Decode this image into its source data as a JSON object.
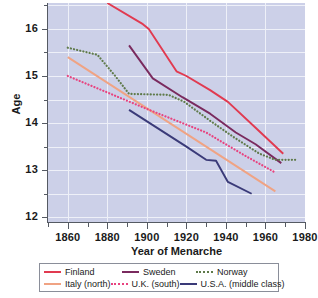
{
  "chart_data": {
    "type": "line",
    "title": "",
    "xlabel": "Year of Menarche",
    "ylabel": "Age",
    "xlim": [
      1850,
      1980
    ],
    "ylim": [
      11.9,
      16.55
    ],
    "xticks": [
      1860,
      1880,
      1900,
      1920,
      1940,
      1960,
      1980
    ],
    "yticks": [
      12,
      13,
      14,
      15,
      16
    ],
    "yminorticks": [
      12.5,
      13.5,
      14.5,
      15.5,
      16.5
    ],
    "xminorticks": [
      1850,
      1870,
      1890,
      1910,
      1930,
      1950,
      1970
    ],
    "grid": true,
    "legend_position": "below",
    "plot_background": "#ccd0e8",
    "gridline_color": "#eef0f8",
    "series": [
      {
        "name": "Finland",
        "color": "#e13a50",
        "style": "solid",
        "x": [
          1880,
          1898,
          1901,
          1915,
          1920,
          1932,
          1941,
          1955,
          1969
        ],
        "y": [
          16.55,
          16.1,
          16.0,
          15.1,
          15.0,
          14.7,
          14.45,
          13.9,
          13.35
        ]
      },
      {
        "name": "Sweden",
        "color": "#7a2a5e",
        "style": "solid",
        "x": [
          1891,
          1903,
          1918,
          1932,
          1945,
          1955,
          1968
        ],
        "y": [
          15.65,
          14.95,
          14.55,
          14.2,
          13.8,
          13.55,
          13.15
        ]
      },
      {
        "name": "Norway",
        "color": "#5f7a4a",
        "style": "dotted",
        "x": [
          1860,
          1875,
          1884,
          1891,
          1911,
          1919,
          1932,
          1944,
          1957,
          1965,
          1975
        ],
        "y": [
          15.6,
          15.45,
          15.0,
          14.62,
          14.6,
          14.45,
          14.05,
          13.7,
          13.35,
          13.22,
          13.22
        ]
      },
      {
        "name": "Italy (north)",
        "color": "#f0a383",
        "style": "solid",
        "x": [
          1860,
          1965
        ],
        "y": [
          15.4,
          12.55
        ]
      },
      {
        "name": "U.K. (south)",
        "color": "#e8437f",
        "style": "dotted",
        "x": [
          1860,
          1900,
          1930,
          1950,
          1965
        ],
        "y": [
          15.0,
          14.3,
          13.8,
          13.3,
          12.95
        ]
      },
      {
        "name": "U.S.A. (middle class)",
        "color": "#3a3a78",
        "style": "solid",
        "x": [
          1891,
          1920,
          1930,
          1935,
          1941,
          1953
        ],
        "y": [
          14.28,
          13.5,
          13.22,
          13.2,
          12.75,
          12.5
        ]
      }
    ]
  },
  "axes": {
    "y_title": "Age",
    "x_title": "Year of Menarche",
    "y_tick_labels": [
      "16",
      "15",
      "14",
      "13",
      "12"
    ],
    "x_tick_labels": [
      "1860",
      "1880",
      "1900",
      "1920",
      "1940",
      "1960",
      "1980"
    ]
  },
  "legend": {
    "rows": [
      [
        {
          "label": "Finland",
          "color": "#e13a50",
          "style": "solid"
        },
        {
          "label": "Sweden",
          "color": "#7a2a5e",
          "style": "solid"
        },
        {
          "label": "Norway",
          "color": "#5f7a4a",
          "style": "dotted"
        }
      ],
      [
        {
          "label": "Italy (north)",
          "color": "#f0a383",
          "style": "solid"
        },
        {
          "label": "U.K. (south)",
          "color": "#e8437f",
          "style": "dotted"
        },
        {
          "label": "U.S.A. (middle class)",
          "color": "#3a3a78",
          "style": "solid"
        }
      ]
    ]
  }
}
